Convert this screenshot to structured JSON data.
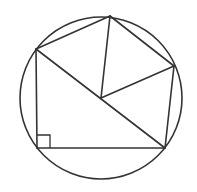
{
  "diagram": {
    "stroke_color": "#333333",
    "background": "#ffffff",
    "circle": {
      "cx": 101,
      "cy": 98,
      "r": 81
    },
    "points": {
      "A": {
        "x": 36,
        "y": 49
      },
      "B": {
        "x": 110,
        "y": 16
      },
      "C": {
        "x": 174,
        "y": 66
      },
      "D": {
        "x": 165,
        "y": 148
      },
      "E": {
        "x": 37,
        "y": 148
      },
      "O": {
        "x": 101,
        "y": 98
      }
    },
    "segments": [
      [
        "A",
        "B"
      ],
      [
        "B",
        "C"
      ],
      [
        "C",
        "D"
      ],
      [
        "D",
        "E"
      ],
      [
        "E",
        "A"
      ],
      [
        "A",
        "D"
      ],
      [
        "B",
        "O"
      ],
      [
        "C",
        "O"
      ]
    ],
    "right_angle_marker": {
      "at": "E",
      "size": 13
    }
  }
}
